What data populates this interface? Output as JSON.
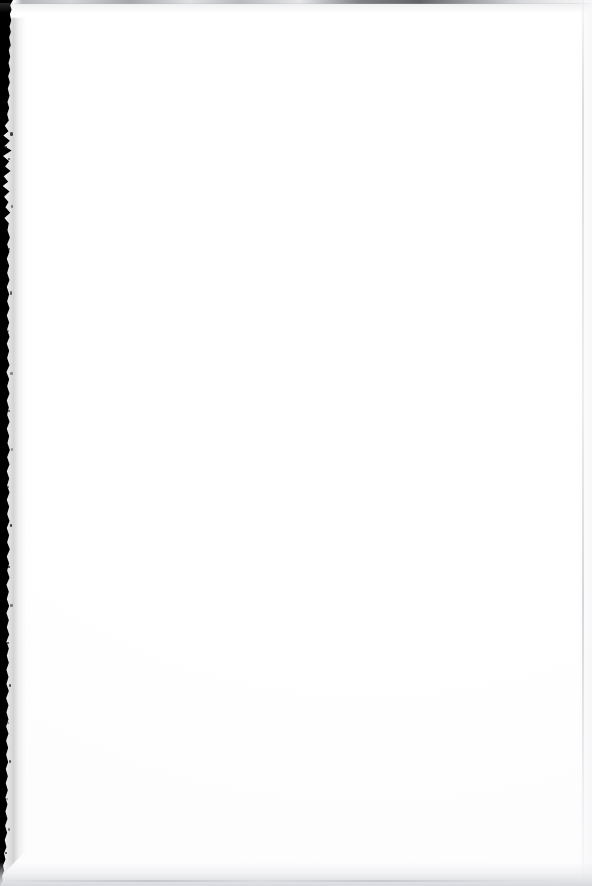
{
  "page": {
    "kind": "scanned-blank-page",
    "width": 592,
    "height": 886,
    "visible_text": "",
    "body_text_present": false,
    "note": "Blank scanned sheet: no headings, body text, figures, page number, header or footer are rendered in the pixels."
  },
  "colors": {
    "paper": "#ffffff",
    "gutter_dark": "#000000",
    "top_edge_line": "#6c6e74",
    "bottom_shadow": "#d6d7dc",
    "right_edge_line": "#cecfd4"
  },
  "artifacts": {
    "left_gutter": {
      "name": "scanner-gutter-strip",
      "description": "Solid black vertical band along the left margin with a ragged, torn right boundary; widest near the top where a notch bulges inward, tapering and fading out at the bottom-left corner.",
      "approx_width_px": 11,
      "starts_y_px": 6,
      "fades_out_y_px": 862
    },
    "top_edge": {
      "name": "top-edge-scan-line",
      "description": "Thin uneven gray line across the full top edge, densest toward the right of center.",
      "approx_height_px": 3
    },
    "right_edge": {
      "name": "right-edge-rule",
      "description": "Very faint vertical gray rule a few pixels in from the right edge.",
      "approx_width_px": 2
    },
    "bottom_edge": {
      "name": "bottom-edge-shadow",
      "description": "Soft light-gray shadow band fading upward from the bottom edge.",
      "approx_height_px": 22
    }
  }
}
